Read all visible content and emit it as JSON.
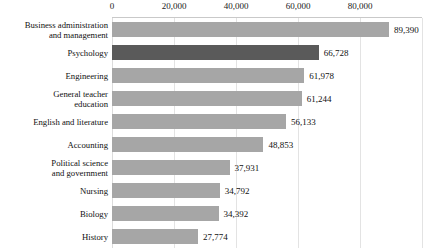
{
  "chart_data": {
    "type": "bar",
    "orientation": "horizontal",
    "title": "",
    "xlabel": "",
    "ylabel": "",
    "xlim": [
      0,
      100000
    ],
    "grid": true,
    "legend": null,
    "axis_position": "top",
    "tick_labels": [
      "0",
      "20,000",
      "40,000",
      "60,000",
      "80,000"
    ],
    "ticks": [
      0,
      20000,
      40000,
      60000,
      80000
    ],
    "categories": [
      "Business administration and management",
      "Psychology",
      "Engineering",
      "General teacher education",
      "English and literature",
      "Accounting",
      "Political science and government",
      "Nursing",
      "Biology",
      "History"
    ],
    "values": [
      89390,
      66728,
      61978,
      61244,
      56133,
      48853,
      37931,
      34792,
      34392,
      27774
    ],
    "value_labels": [
      "89,390",
      "66,728",
      "61,978",
      "61,244",
      "56,133",
      "48,853",
      "37,931",
      "34,792",
      "34,392",
      "27,774"
    ],
    "highlighted_index": 1,
    "colors": {
      "bar": "#a6a6a6",
      "bar_highlight": "#5a5a5a",
      "gridline": "#e3e3e3",
      "axis_rule": "#c9c9c9",
      "text": "#111111",
      "background": "#ffffff"
    },
    "category_lines": [
      [
        "Business administration",
        "and management"
      ],
      [
        "Psychology"
      ],
      [
        "Engineering"
      ],
      [
        "General teacher",
        "education"
      ],
      [
        "English and literature"
      ],
      [
        "Accounting"
      ],
      [
        "Political science",
        "and government"
      ],
      [
        "Nursing"
      ],
      [
        "Biology"
      ],
      [
        "History"
      ]
    ]
  }
}
